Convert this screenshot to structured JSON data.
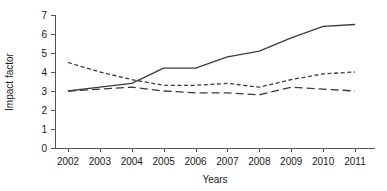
{
  "chart_data": {
    "type": "line",
    "title": "",
    "xlabel": "Years",
    "ylabel": "Impact factor",
    "categories": [
      "2002",
      "2003",
      "2004",
      "2005",
      "2006",
      "2007",
      "2008",
      "2009",
      "2010",
      "2011"
    ],
    "x": [
      2002,
      2003,
      2004,
      2005,
      2006,
      2007,
      2008,
      2009,
      2010,
      2011
    ],
    "xlim": [
      2002,
      2011
    ],
    "ylim": [
      0,
      7
    ],
    "yticks": [
      "0",
      "1",
      "2",
      "3",
      "4",
      "5",
      "6",
      "7"
    ],
    "grid": false,
    "legend": "none",
    "series": [
      {
        "name": "solid-series",
        "style": "solid",
        "values": [
          3.0,
          3.2,
          3.4,
          4.2,
          4.2,
          4.8,
          5.1,
          5.8,
          6.4,
          6.5
        ]
      },
      {
        "name": "dotted-series",
        "style": "dotted",
        "values": [
          4.5,
          4.0,
          3.6,
          3.3,
          3.3,
          3.4,
          3.2,
          3.6,
          3.9,
          4.0
        ]
      },
      {
        "name": "dashed-series",
        "style": "dashed",
        "values": [
          3.0,
          3.1,
          3.2,
          3.0,
          2.9,
          2.9,
          2.8,
          3.2,
          3.1,
          3.0
        ]
      }
    ]
  },
  "axes": {
    "y_axis_label": "Impact factor",
    "x_axis_label": "Years"
  }
}
